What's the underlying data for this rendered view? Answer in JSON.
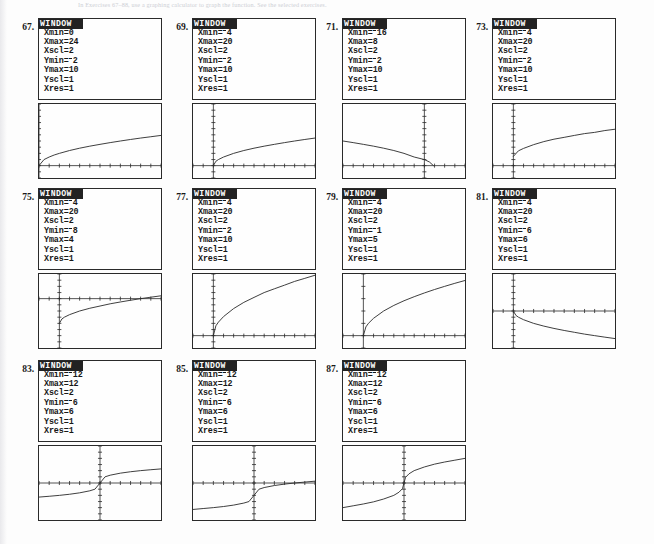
{
  "page": {
    "header_text": "In Exercises 67–88, use a graphing calculator to graph the function. See the selected exercises.",
    "background": "#fdfdfd",
    "ink": "#1a1a1a"
  },
  "calculator": {
    "window_title": "WINDOW",
    "field_labels": [
      "Xmin",
      "Xmax",
      "Xscl",
      "Ymin",
      "Ymax",
      "Yscl",
      "Xres"
    ]
  },
  "exercises": [
    {
      "number": "67.",
      "col": 0,
      "row": 0,
      "window": {
        "Xmin": "0",
        "Xmax": "24",
        "Xscl": "2",
        "Ymin": "-2",
        "Ymax": "10",
        "Yscl": "1",
        "Xres": "1"
      },
      "chart_data": {
        "type": "line",
        "title": "67.",
        "xlabel": "",
        "ylabel": "",
        "xlim": [
          0,
          24
        ],
        "ylim": [
          -2,
          10
        ],
        "xscl": 2,
        "yscl": 1,
        "grid": false,
        "legend": null,
        "curve_shape": "square-root-increasing",
        "x": [
          0,
          1,
          2,
          3,
          4,
          6,
          8,
          10,
          12,
          14,
          16,
          18,
          20,
          22,
          24
        ],
        "y": [
          0,
          1.0,
          1.41,
          1.73,
          2.0,
          2.45,
          2.83,
          3.16,
          3.46,
          3.74,
          4.0,
          4.24,
          4.47,
          4.69,
          4.9
        ]
      }
    },
    {
      "number": "69.",
      "col": 1,
      "row": 0,
      "window": {
        "Xmin": "-4",
        "Xmax": "20",
        "Xscl": "2",
        "Ymin": "-2",
        "Ymax": "10",
        "Yscl": "1",
        "Xres": "1"
      },
      "chart_data": {
        "type": "line",
        "title": "69.",
        "xlabel": "",
        "ylabel": "",
        "xlim": [
          -4,
          20
        ],
        "ylim": [
          -2,
          10
        ],
        "xscl": 2,
        "yscl": 1,
        "grid": false,
        "legend": null,
        "curve_shape": "square-root-increasing-from-origin",
        "x": [
          0,
          0.5,
          1,
          2,
          4,
          6,
          8,
          10,
          12,
          14,
          16,
          18,
          20
        ],
        "y": [
          0,
          0.71,
          1.0,
          1.41,
          2.0,
          2.45,
          2.83,
          3.16,
          3.46,
          3.74,
          4.0,
          4.24,
          4.47
        ]
      }
    },
    {
      "number": "71.",
      "col": 2,
      "row": 0,
      "window": {
        "Xmin": "-16",
        "Xmax": "8",
        "Xscl": "2",
        "Ymin": "-2",
        "Ymax": "10",
        "Yscl": "1",
        "Xres": "1"
      },
      "chart_data": {
        "type": "line",
        "title": "71.",
        "xlabel": "",
        "ylabel": "",
        "xlim": [
          -16,
          8
        ],
        "ylim": [
          -2,
          10
        ],
        "xscl": 2,
        "yscl": 1,
        "grid": false,
        "legend": null,
        "curve_shape": "square-root-reflected-decreasing",
        "x": [
          -16,
          -14,
          -12,
          -10,
          -8,
          -6,
          -4,
          -2,
          0,
          1,
          1.8
        ],
        "y": [
          4.0,
          3.74,
          3.46,
          3.16,
          2.83,
          2.45,
          2.0,
          1.41,
          1.0,
          0.6,
          0
        ]
      }
    },
    {
      "number": "73.",
      "col": 3,
      "row": 0,
      "window": {
        "Xmin": "-4",
        "Xmax": "20",
        "Xscl": "2",
        "Ymin": "-2",
        "Ymax": "10",
        "Yscl": "1",
        "Xres": "1"
      },
      "chart_data": {
        "type": "line",
        "title": "73.",
        "xlabel": "",
        "ylabel": "",
        "xlim": [
          -4,
          20
        ],
        "ylim": [
          -2,
          10
        ],
        "xscl": 2,
        "yscl": 1,
        "grid": false,
        "legend": null,
        "curve_shape": "square-root-shifted-up",
        "x": [
          0,
          1,
          2,
          4,
          6,
          8,
          10,
          12,
          14,
          16,
          18,
          20
        ],
        "y": [
          1.5,
          2.4,
          2.8,
          3.4,
          3.9,
          4.3,
          4.6,
          4.9,
          5.2,
          5.4,
          5.7,
          5.9
        ]
      }
    },
    {
      "number": "75.",
      "col": 0,
      "row": 1,
      "window": {
        "Xmin": "-4",
        "Xmax": "20",
        "Xscl": "2",
        "Ymin": "-8",
        "Ymax": "4",
        "Yscl": "1",
        "Xres": "1"
      },
      "chart_data": {
        "type": "line",
        "title": "75.",
        "xlabel": "",
        "ylabel": "",
        "xlim": [
          -4,
          20
        ],
        "ylim": [
          -8,
          4
        ],
        "xscl": 2,
        "yscl": 1,
        "grid": false,
        "legend": null,
        "curve_shape": "square-root-increasing-from-below",
        "x": [
          0,
          0.5,
          1,
          2,
          4,
          6,
          8,
          10,
          12,
          14,
          16,
          18,
          20
        ],
        "y": [
          -4.0,
          -3.3,
          -3.0,
          -2.6,
          -2.0,
          -1.55,
          -1.2,
          -0.84,
          -0.54,
          -0.26,
          0.0,
          0.24,
          0.47
        ]
      }
    },
    {
      "number": "77.",
      "col": 1,
      "row": 1,
      "window": {
        "Xmin": "-4",
        "Xmax": "20",
        "Xscl": "2",
        "Ymin": "-2",
        "Ymax": "10",
        "Yscl": "1",
        "Xres": "1"
      },
      "chart_data": {
        "type": "line",
        "title": "77.",
        "xlabel": "",
        "ylabel": "",
        "xlim": [
          -4,
          20
        ],
        "ylim": [
          -2,
          10
        ],
        "xscl": 2,
        "yscl": 1,
        "grid": false,
        "legend": null,
        "curve_shape": "square-root-steep-increasing",
        "x": [
          0,
          0.5,
          1,
          2,
          4,
          6,
          8,
          10,
          12,
          14,
          16,
          18,
          20
        ],
        "y": [
          0,
          1.6,
          2.2,
          3.1,
          4.4,
          5.4,
          6.2,
          7.0,
          7.6,
          8.2,
          8.8,
          9.3,
          9.8
        ]
      }
    },
    {
      "number": "79.",
      "col": 2,
      "row": 1,
      "window": {
        "Xmin": "-4",
        "Xmax": "20",
        "Xscl": "2",
        "Ymin": "-1",
        "Ymax": "5",
        "Yscl": "1",
        "Xres": "1"
      },
      "chart_data": {
        "type": "line",
        "title": "79.",
        "xlabel": "",
        "ylabel": "",
        "xlim": [
          -4,
          20
        ],
        "ylim": [
          -1,
          5
        ],
        "xscl": 2,
        "yscl": 1,
        "grid": false,
        "legend": null,
        "curve_shape": "square-root-increasing",
        "x": [
          0,
          0.5,
          1,
          2,
          4,
          6,
          8,
          10,
          12,
          14,
          16,
          18,
          20
        ],
        "y": [
          0,
          0.71,
          1.0,
          1.41,
          2.0,
          2.45,
          2.83,
          3.16,
          3.46,
          3.74,
          4.0,
          4.24,
          4.47
        ]
      }
    },
    {
      "number": "81.",
      "col": 3,
      "row": 1,
      "window": {
        "Xmin": "-4",
        "Xmax": "20",
        "Xscl": "2",
        "Ymin": "-6",
        "Ymax": "6",
        "Yscl": "1",
        "Xres": "1"
      },
      "chart_data": {
        "type": "line",
        "title": "81.",
        "xlabel": "",
        "ylabel": "",
        "xlim": [
          -4,
          20
        ],
        "ylim": [
          -6,
          6
        ],
        "xscl": 2,
        "yscl": 1,
        "grid": false,
        "legend": null,
        "curve_shape": "negative-square-root-decreasing",
        "x": [
          0,
          0.5,
          1,
          2,
          4,
          6,
          8,
          10,
          12,
          14,
          16,
          18,
          20
        ],
        "y": [
          0,
          -0.71,
          -1.0,
          -1.41,
          -2.0,
          -2.45,
          -2.83,
          -3.16,
          -3.46,
          -3.74,
          -4.0,
          -4.24,
          -4.47
        ]
      }
    },
    {
      "number": "83.",
      "col": 0,
      "row": 2,
      "window": {
        "Xmin": "-12",
        "Xmax": "12",
        "Xscl": "2",
        "Ymin": "-6",
        "Ymax": "6",
        "Yscl": "1",
        "Xres": "1"
      },
      "chart_data": {
        "type": "line",
        "title": "83.",
        "xlabel": "",
        "ylabel": "",
        "xlim": [
          -12,
          12
        ],
        "ylim": [
          -6,
          6
        ],
        "xscl": 2,
        "yscl": 1,
        "grid": false,
        "legend": null,
        "curve_shape": "cube-root-odd-symmetric",
        "x": [
          -12,
          -10,
          -8,
          -6,
          -4,
          -2,
          -1,
          0,
          1,
          2,
          4,
          6,
          8,
          10,
          12
        ],
        "y": [
          -2.29,
          -2.15,
          -2.0,
          -1.82,
          -1.59,
          -1.26,
          -1.0,
          0,
          1.0,
          1.26,
          1.59,
          1.82,
          2.0,
          2.15,
          2.29
        ]
      }
    },
    {
      "number": "85.",
      "col": 1,
      "row": 2,
      "window": {
        "Xmin": "-12",
        "Xmax": "12",
        "Xscl": "2",
        "Ymin": "-6",
        "Ymax": "6",
        "Yscl": "1",
        "Xres": "1"
      },
      "chart_data": {
        "type": "line",
        "title": "85.",
        "xlabel": "",
        "ylabel": "",
        "xlim": [
          -12,
          12
        ],
        "ylim": [
          -6,
          6
        ],
        "xscl": 2,
        "yscl": 1,
        "grid": false,
        "legend": null,
        "curve_shape": "cube-root-shifted-down",
        "x": [
          -12,
          -10,
          -8,
          -6,
          -4,
          -2,
          -1,
          0,
          1,
          2,
          4,
          6,
          8,
          10,
          12
        ],
        "y": [
          -4.29,
          -4.15,
          -4.0,
          -3.82,
          -3.59,
          -3.26,
          -3.0,
          -2.0,
          -1.0,
          -0.74,
          -0.41,
          -0.18,
          0.0,
          0.15,
          0.29
        ]
      }
    },
    {
      "number": "87.",
      "col": 2,
      "row": 2,
      "window": {
        "Xmin": "-12",
        "Xmax": "12",
        "Xscl": "2",
        "Ymin": "-6",
        "Ymax": "6",
        "Yscl": "1",
        "Xres": "1"
      },
      "chart_data": {
        "type": "line",
        "title": "87.",
        "xlabel": "",
        "ylabel": "",
        "xlim": [
          -12,
          12
        ],
        "ylim": [
          -6,
          6
        ],
        "xscl": 2,
        "yscl": 1,
        "grid": false,
        "legend": null,
        "curve_shape": "cube-root-steep-odd-symmetric",
        "x": [
          -12,
          -10,
          -8,
          -6,
          -4,
          -2,
          -1,
          -0.3,
          0,
          0.3,
          1,
          2,
          4,
          6,
          8,
          10,
          12
        ],
        "y": [
          -4.0,
          -3.7,
          -3.4,
          -3.05,
          -2.6,
          -2.0,
          -1.5,
          -0.9,
          0,
          0.9,
          1.5,
          2.0,
          2.6,
          3.05,
          3.4,
          3.7,
          4.0
        ]
      }
    }
  ]
}
